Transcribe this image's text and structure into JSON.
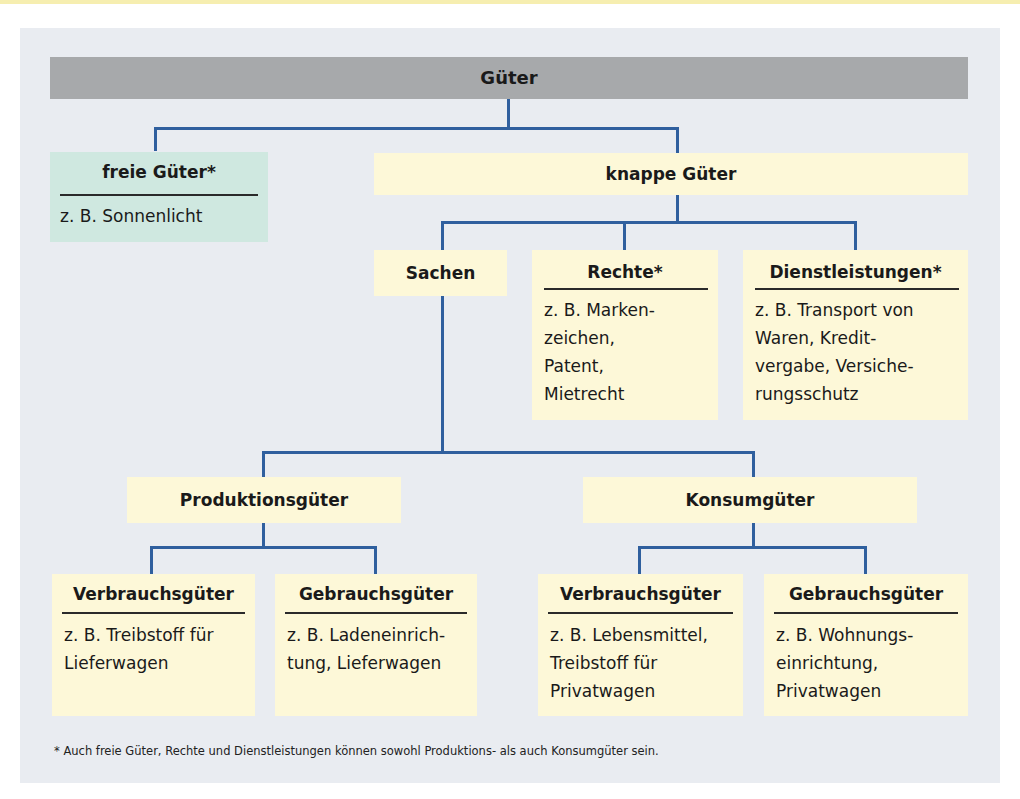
{
  "root": {
    "label": "Güter"
  },
  "level1": {
    "free": {
      "title": "freie Güter*",
      "example": "z. B. Sonnenlicht"
    },
    "scarce": {
      "title": "knappe Güter"
    }
  },
  "level2": {
    "things": {
      "title": "Sachen"
    },
    "rights": {
      "title": "Rechte*",
      "example": "z. B. Marken-\nzeichen,\nPatent,\nMietrecht"
    },
    "services": {
      "title": "Dienstleistungen*",
      "example": "z. B. Transport von\nWaren, Kredit-\nvergabe, Versiche-\nrungsschutz"
    }
  },
  "level3": {
    "production": {
      "title": "Produktionsgüter"
    },
    "consumer": {
      "title": "Konsumgüter"
    }
  },
  "level4": [
    {
      "title": "Verbrauchsgüter",
      "example": "z. B. Treibstoff für\nLieferwagen"
    },
    {
      "title": "Gebrauchsgüter",
      "example": "z. B. Ladeneinrich-\ntung, Lieferwagen"
    },
    {
      "title": "Verbrauchsgüter",
      "example": "z. B. Lebensmittel,\nTreibstoff für\nPrivatwagen"
    },
    {
      "title": "Gebrauchsgüter",
      "example": "z. B. Wohnungs-\neinrichtung,\nPrivatwagen"
    }
  ],
  "footnote": "* Auch freie Güter, Rechte und Dienstleistungen können sowohl Produktions- als auch Konsumgüter sein.",
  "colors": {
    "root_bar": "#a7a9ab",
    "free_box": "#cfe8e0",
    "box": "#fdf8d8",
    "connector": "#2f5f9e",
    "panel": "#e9ecf1"
  }
}
